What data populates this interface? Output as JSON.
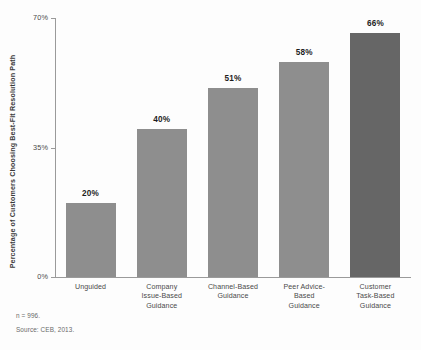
{
  "chart_data": {
    "type": "bar",
    "title": "",
    "subtitle": "",
    "xlabel": "",
    "ylabel": "Percentage of Customers Choosing Best-Fit Resolution Path",
    "categories": [
      "Unguided",
      "Company Issue-Based Guidance",
      "Channel-Based Guidance",
      "Peer Advice-Based Guidance",
      "Customer Task-Based Guidance"
    ],
    "category_lines": [
      [
        "Unguided"
      ],
      [
        "Company",
        "Issue-Based",
        "Guidance"
      ],
      [
        "Channel-Based",
        "Guidance"
      ],
      [
        "Peer Advice-",
        "Based",
        "Guidance"
      ],
      [
        "Customer",
        "Task-Based",
        "Guidance"
      ]
    ],
    "values": [
      20,
      40,
      51,
      58,
      66
    ],
    "value_labels": [
      "20%",
      "40%",
      "51%",
      "58%",
      "66%"
    ],
    "ylim": [
      0,
      70
    ],
    "yticks": [
      0,
      35,
      70
    ],
    "ytick_labels": [
      "0%",
      "35%",
      "70%"
    ],
    "grid": false,
    "legend": null,
    "bar_color": "#8e8e8e",
    "highlight_color": "#666666",
    "highlight_index": 4,
    "axis_color": "#9a9a9a"
  },
  "footnotes": {
    "sample_size": "n = 996.",
    "source": "Source: CEB, 2013."
  }
}
